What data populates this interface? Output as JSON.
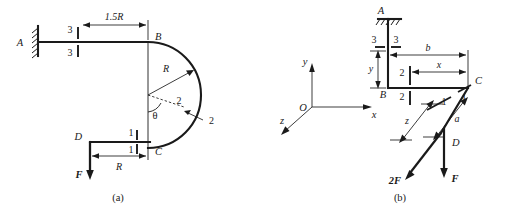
{
  "figure": {
    "panels": [
      {
        "caption": "(a)",
        "points": {
          "a": "A",
          "b": "B",
          "c": "C",
          "d": "D"
        },
        "dimensions": {
          "span_ab": "1.5R",
          "radius": "R",
          "span_dc": "R"
        },
        "sections": {
          "section_3_top": "3",
          "section_3_bottom": "3",
          "section_2_near": "2",
          "section_2_far": "2",
          "section_1_top": "1",
          "section_1_bottom": "1"
        },
        "angle_label": "θ",
        "forces": {
          "f_at_d": "F"
        }
      },
      {
        "caption": "(b)",
        "points": {
          "a": "A",
          "b": "B",
          "c": "C",
          "d": "D",
          "origin": "O"
        },
        "axes": {
          "x": "x",
          "y": "y",
          "z": "z"
        },
        "dimensions": {
          "b": "b",
          "x": "x",
          "y": "y",
          "z": "z",
          "a": "a"
        },
        "sections": {
          "section_3_left": "3",
          "section_3_right": "3",
          "section_2_top": "2",
          "section_2_bottom": "2",
          "section_1_left": "1",
          "section_1_right": "1"
        },
        "forces": {
          "f_vertical": "F",
          "two_f_axial": "2F"
        }
      }
    ]
  },
  "colors": {
    "ink": "#1a1a1a",
    "paper": "#ffffff"
  }
}
